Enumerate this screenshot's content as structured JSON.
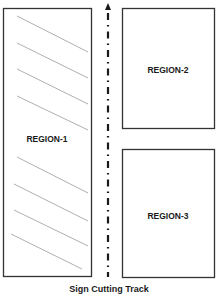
{
  "diagram": {
    "caption": "Sign Cutting Track",
    "track": {
      "label": "Sign Cutting Track",
      "direction": "up",
      "style": "dash-dot",
      "color": "#1a1a1a"
    },
    "regions": [
      {
        "id": "region-1",
        "label": "REGION-1",
        "hatched": true
      },
      {
        "id": "region-2",
        "label": "REGION-2",
        "hatched": false
      },
      {
        "id": "region-3",
        "label": "REGION-3",
        "hatched": false
      }
    ],
    "colors": {
      "border": "#333333",
      "hatch": "#9a9a9a",
      "text": "#1a1a1a",
      "background": "#ffffff"
    }
  }
}
